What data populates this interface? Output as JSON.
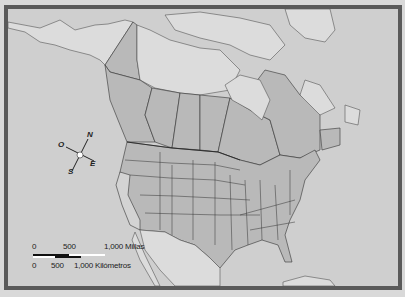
{
  "map": {
    "title": "",
    "colors": {
      "ocean": "#cfcfcf",
      "land_light": "#dcdcdc",
      "land_states": "#b9b9b9",
      "california": "#d3d3d3",
      "border_frame": "#5a5a5a",
      "borders": "#333333"
    }
  },
  "compass": {
    "north": "N",
    "south": "S",
    "east": "E",
    "west": "O"
  },
  "scale_bar": {
    "miles": {
      "ticks": [
        "0",
        "500",
        "1,000 Millas"
      ]
    },
    "kilometers": {
      "ticks": [
        "0",
        "500",
        "1,000 Kilómetros"
      ]
    }
  }
}
